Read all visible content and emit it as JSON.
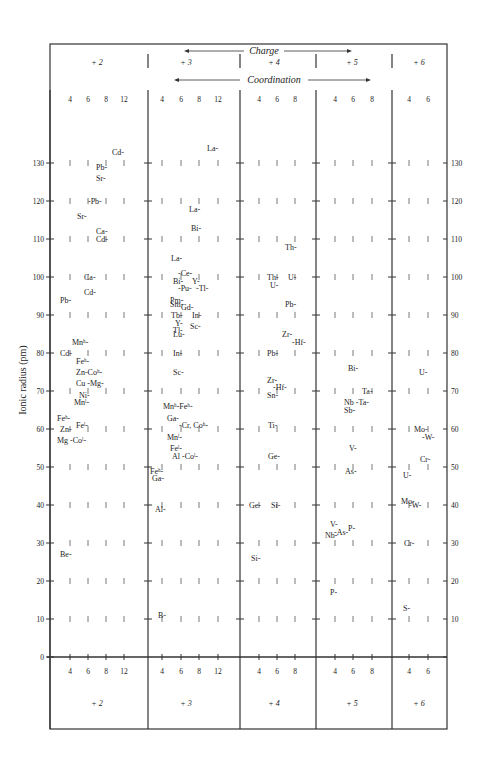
{
  "chart_data": {
    "type": "scatter",
    "header": {
      "charge_label": "Charge",
      "coordination_label": "Coordination"
    },
    "ylabel": "Ionic radius (pm)",
    "ylim": [
      0,
      140
    ],
    "yticks": [
      0,
      10,
      20,
      30,
      40,
      50,
      60,
      70,
      80,
      90,
      100,
      110,
      120,
      130
    ],
    "groups": [
      {
        "charge": "+ 2",
        "coordinations": [
          "4",
          "6",
          "8",
          "12"
        ]
      },
      {
        "charge": "+ 3",
        "coordinations": [
          "4",
          "6",
          "8",
          "12"
        ]
      },
      {
        "charge": "+ 4",
        "coordinations": [
          "4",
          "6",
          "8"
        ]
      },
      {
        "charge": "+ 5",
        "coordinations": [
          "4",
          "6",
          "8"
        ]
      },
      {
        "charge": "+ 6",
        "coordinations": [
          "4",
          "6"
        ]
      }
    ],
    "points": [
      {
        "g": 0,
        "label": "Cd",
        "x": 112,
        "r": 133
      },
      {
        "g": 0,
        "label": "Pb",
        "x": 96,
        "r": 129
      },
      {
        "g": 0,
        "label": "Sr",
        "x": 96,
        "r": 126
      },
      {
        "g": 0,
        "label": "-Pb",
        "x": 88,
        "r": 120
      },
      {
        "g": 0,
        "label": "Sr",
        "x": 77,
        "r": 116
      },
      {
        "g": 0,
        "label": "Ca",
        "x": 96,
        "r": 112
      },
      {
        "g": 0,
        "label": "Cd",
        "x": 96,
        "r": 110
      },
      {
        "g": 0,
        "label": "Ca",
        "x": 84,
        "r": 100
      },
      {
        "g": 0,
        "label": "Cd",
        "x": 84,
        "r": 96
      },
      {
        "g": 0,
        "label": "Pb",
        "x": 60,
        "r": 94
      },
      {
        "g": 0,
        "label": "Mnʰ",
        "x": 72,
        "r": 83
      },
      {
        "g": 0,
        "label": "Cd",
        "x": 60,
        "r": 80
      },
      {
        "g": 0,
        "label": "Feʰ",
        "x": 76,
        "r": 78
      },
      {
        "g": 0,
        "label": "Zn-Coʰ",
        "x": 76,
        "r": 75
      },
      {
        "g": 0,
        "label": "Cu -Mg",
        "x": 76,
        "r": 72
      },
      {
        "g": 0,
        "label": "Ni",
        "x": 79,
        "r": 69
      },
      {
        "g": 0,
        "label": "Mnˡ",
        "x": 74,
        "r": 67
      },
      {
        "g": 0,
        "label": "Feʰ",
        "x": 57,
        "r": 63
      },
      {
        "g": 0,
        "label": "Feˡ",
        "x": 76,
        "r": 61
      },
      {
        "g": 0,
        "label": "Zn",
        "x": 60,
        "r": 60
      },
      {
        "g": 0,
        "label": "Mg -Coˡ",
        "x": 57,
        "r": 57
      },
      {
        "g": 0,
        "label": "Be",
        "x": 60,
        "r": 27
      },
      {
        "g": 1,
        "label": "La",
        "x": 207,
        "r": 134
      },
      {
        "g": 1,
        "label": "La",
        "x": 189,
        "r": 118
      },
      {
        "g": 1,
        "label": "Bi",
        "x": 191,
        "r": 113
      },
      {
        "g": 1,
        "label": "La",
        "x": 171,
        "r": 105
      },
      {
        "g": 1,
        "label": "-Ce",
        "x": 178,
        "r": 101
      },
      {
        "g": 1,
        "label": "Bi",
        "x": 173,
        "r": 99
      },
      {
        "g": 1,
        "label": "Y",
        "x": 192,
        "r": 99
      },
      {
        "g": 1,
        "label": "-Pu",
        "x": 178,
        "r": 97
      },
      {
        "g": 1,
        "label": "-Tl",
        "x": 196,
        "r": 97
      },
      {
        "g": 1,
        "label": "Pm",
        "x": 170,
        "r": 94
      },
      {
        "g": 1,
        "label": "Sm",
        "x": 170,
        "r": 93
      },
      {
        "g": 1,
        "label": "Gd",
        "x": 181,
        "r": 92
      },
      {
        "g": 1,
        "label": "Tb",
        "x": 171,
        "r": 90
      },
      {
        "g": 1,
        "label": "In",
        "x": 192,
        "r": 90
      },
      {
        "g": 1,
        "label": "Y",
        "x": 175,
        "r": 88
      },
      {
        "g": 1,
        "label": "Tl",
        "x": 173,
        "r": 86
      },
      {
        "g": 1,
        "label": "Sc",
        "x": 190,
        "r": 87
      },
      {
        "g": 1,
        "label": "Lu",
        "x": 173,
        "r": 85
      },
      {
        "g": 1,
        "label": "In",
        "x": 173,
        "r": 80
      },
      {
        "g": 1,
        "label": "Sc",
        "x": 173,
        "r": 75
      },
      {
        "g": 1,
        "label": "Mnʰ-Feʰ",
        "x": 163,
        "r": 66
      },
      {
        "g": 1,
        "label": "Ga",
        "x": 167,
        "r": 63
      },
      {
        "g": 1,
        "label": "-Cr, Coʰ",
        "x": 179,
        "r": 61
      },
      {
        "g": 1,
        "label": "Mnˡ",
        "x": 167,
        "r": 58
      },
      {
        "g": 1,
        "label": "Feˡ",
        "x": 170,
        "r": 55
      },
      {
        "g": 1,
        "label": "Al -Coˡ",
        "x": 172,
        "r": 53
      },
      {
        "g": 1,
        "label": "Feʰ",
        "x": 150,
        "r": 49
      },
      {
        "g": 1,
        "label": "Ga",
        "x": 152,
        "r": 47
      },
      {
        "g": 1,
        "label": "Al",
        "x": 155,
        "r": 39
      },
      {
        "g": 1,
        "label": "B",
        "x": 158,
        "r": 11
      },
      {
        "g": 2,
        "label": "Th",
        "x": 285,
        "r": 108
      },
      {
        "g": 2,
        "label": "Th",
        "x": 267,
        "r": 100
      },
      {
        "g": 2,
        "label": "U",
        "x": 288,
        "r": 100
      },
      {
        "g": 2,
        "label": "U",
        "x": 270,
        "r": 98
      },
      {
        "g": 2,
        "label": "Pb",
        "x": 285,
        "r": 93
      },
      {
        "g": 2,
        "label": "Zr",
        "x": 282,
        "r": 85
      },
      {
        "g": 2,
        "label": "-Hf",
        "x": 292,
        "r": 83
      },
      {
        "g": 2,
        "label": "Pb",
        "x": 267,
        "r": 80
      },
      {
        "g": 2,
        "label": "Zr",
        "x": 267,
        "r": 73
      },
      {
        "g": 2,
        "label": "-Hf",
        "x": 273,
        "r": 71
      },
      {
        "g": 2,
        "label": "Sn",
        "x": 267,
        "r": 69
      },
      {
        "g": 2,
        "label": "Ti",
        "x": 268,
        "r": 61
      },
      {
        "g": 2,
        "label": "Ge",
        "x": 268,
        "r": 53
      },
      {
        "g": 2,
        "label": "Ge",
        "x": 249,
        "r": 40
      },
      {
        "g": 2,
        "label": "Si",
        "x": 271,
        "r": 40
      },
      {
        "g": 2,
        "label": "Si",
        "x": 251,
        "r": 26
      },
      {
        "g": 3,
        "label": "Bi",
        "x": 348,
        "r": 76
      },
      {
        "g": 3,
        "label": "Ta",
        "x": 362,
        "r": 70
      },
      {
        "g": 3,
        "label": "Nb -Ta",
        "x": 344,
        "r": 67
      },
      {
        "g": 3,
        "label": "Sb",
        "x": 344,
        "r": 65
      },
      {
        "g": 3,
        "label": "V",
        "x": 349,
        "r": 55
      },
      {
        "g": 3,
        "label": "As",
        "x": 345,
        "r": 49
      },
      {
        "g": 3,
        "label": "V",
        "x": 330,
        "r": 35
      },
      {
        "g": 3,
        "label": "-As",
        "x": 334,
        "r": 33
      },
      {
        "g": 3,
        "label": "P",
        "x": 348,
        "r": 34
      },
      {
        "g": 3,
        "label": "Nb",
        "x": 325,
        "r": 32
      },
      {
        "g": 3,
        "label": "P",
        "x": 330,
        "r": 17
      },
      {
        "g": 4,
        "label": "U",
        "x": 419,
        "r": 75
      },
      {
        "g": 4,
        "label": "Mo",
        "x": 414,
        "r": 60
      },
      {
        "g": 4,
        "label": "-W",
        "x": 422,
        "r": 58
      },
      {
        "g": 4,
        "label": "Cr",
        "x": 420,
        "r": 52
      },
      {
        "g": 4,
        "label": "U",
        "x": 403,
        "r": 48
      },
      {
        "g": 4,
        "label": "Mo",
        "x": 401,
        "r": 41
      },
      {
        "g": 4,
        "label": "-W",
        "x": 409,
        "r": 40
      },
      {
        "g": 4,
        "label": "Cr",
        "x": 404,
        "r": 30
      },
      {
        "g": 4,
        "label": "S",
        "x": 403,
        "r": 13
      }
    ]
  }
}
